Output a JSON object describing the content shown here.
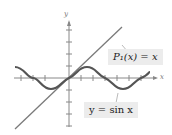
{
  "figure": {
    "axis_labels": {
      "x": "x",
      "y": "y"
    },
    "curves": [
      {
        "name": "taylor-line",
        "label": "P₁(x) = x",
        "color": "#7a7a7a"
      },
      {
        "name": "sine-curve",
        "label": "y = sin x",
        "color": "#555555"
      }
    ]
  }
}
